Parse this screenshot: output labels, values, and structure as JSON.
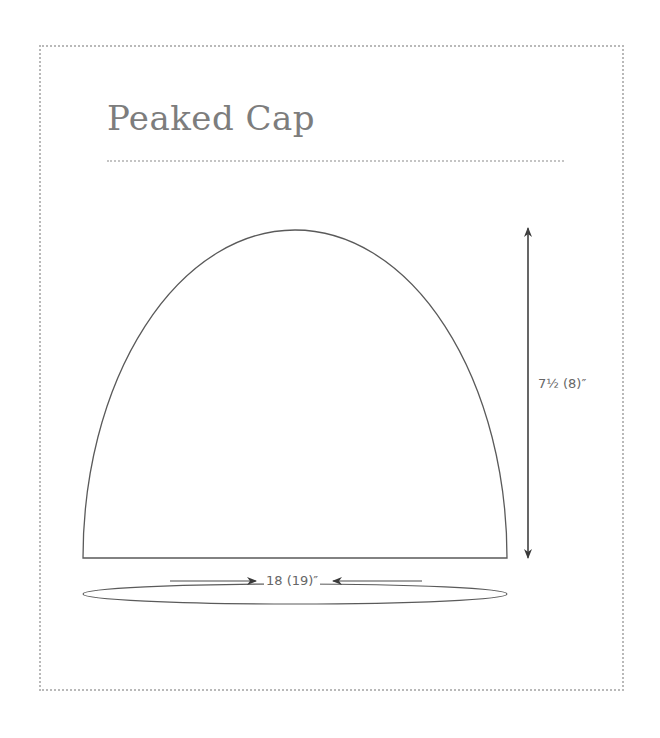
{
  "title": "Peaked Cap",
  "dimensions": {
    "height_label": "7½ (8)″",
    "circumference_label": "18 (19)″"
  },
  "colors": {
    "line": "#5a5a5a",
    "title": "#7d7d7d",
    "dotted_border": "#b9b9b9",
    "label": "#666666"
  }
}
